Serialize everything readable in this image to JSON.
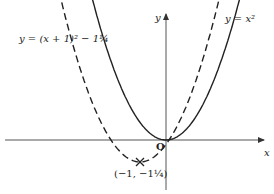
{
  "figure": {
    "labels": {
      "curve_shifted": "y = (x + 1)² − 1¼",
      "curve_base": "y = x²",
      "x_axis": "x",
      "y_axis": "y",
      "origin": "O",
      "vertex": "(−1, −1¼)"
    },
    "colors": {
      "stroke": "#222222",
      "axis": "#555555",
      "background": "#ffffff"
    }
  },
  "chart_data": {
    "type": "line",
    "title": "",
    "xlabel": "x",
    "ylabel": "y",
    "grid": false,
    "series": [
      {
        "name": "y = x²",
        "style": "solid",
        "vertex": [
          0,
          0
        ],
        "x": [
          -2.8,
          -2,
          -1,
          0,
          1,
          2,
          2.8
        ],
        "y": [
          7.84,
          4,
          1,
          0,
          1,
          4,
          7.84
        ]
      },
      {
        "name": "y = (x + 1)² − 1¼",
        "style": "dashed",
        "vertex": [
          -1,
          -1.25
        ],
        "x": [
          -4,
          -3,
          -2,
          -1,
          0,
          1,
          2
        ],
        "y": [
          7.75,
          2.75,
          -0.25,
          -1.25,
          -0.25,
          2.75,
          7.75
        ]
      }
    ],
    "annotations": [
      {
        "text": "(−1, −1¼)",
        "at": [
          -1,
          -1.25
        ]
      },
      {
        "text": "O",
        "at": [
          0,
          0
        ]
      }
    ]
  }
}
